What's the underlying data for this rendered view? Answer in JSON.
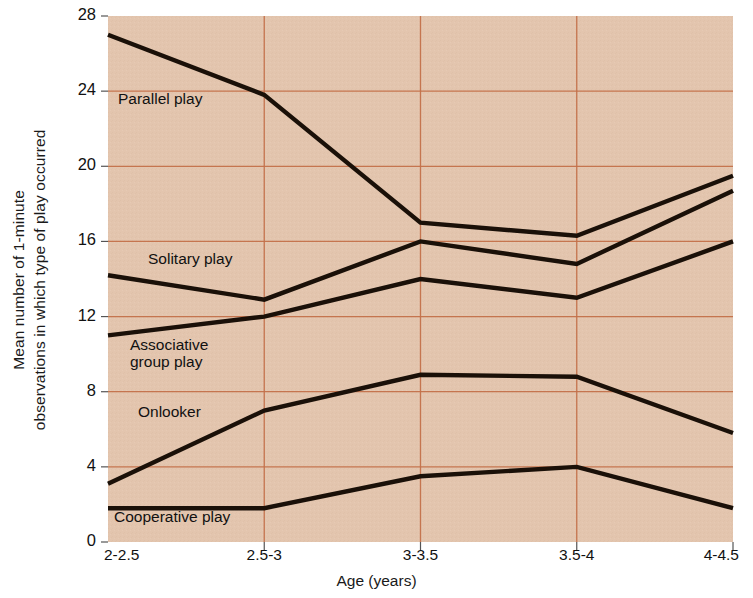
{
  "chart_data": {
    "type": "line",
    "title": "",
    "xlabel": "Age (years)",
    "ylabel_line1": "Mean number of 1-minute",
    "ylabel_line2": "observations in which type of play occurred",
    "categories": [
      "2-2.5",
      "2.5-3",
      "3-3.5",
      "3.5-4",
      "4-4.5"
    ],
    "ylim": [
      0,
      28
    ],
    "yticks": [
      0,
      4,
      8,
      12,
      16,
      20,
      24,
      28
    ],
    "grid": true,
    "legend": "inline-labels",
    "series": [
      {
        "name": "Parallel play",
        "values": [
          27.0,
          23.8,
          17.0,
          16.3,
          19.5
        ]
      },
      {
        "name": "Solitary play",
        "values": [
          14.2,
          12.9,
          16.0,
          14.8,
          18.7
        ]
      },
      {
        "name": "Associative group play",
        "values": [
          11.0,
          12.0,
          14.0,
          13.0,
          16.0
        ]
      },
      {
        "name": "Onlooker",
        "values": [
          3.1,
          7.0,
          8.9,
          8.8,
          5.8
        ]
      },
      {
        "name": "Cooperative play",
        "values": [
          1.8,
          1.8,
          3.5,
          4.0,
          1.8
        ]
      }
    ],
    "series_label_positions": [
      {
        "name": "Parallel play",
        "x": 118,
        "y": 90
      },
      {
        "name": "Solitary play",
        "x": 148,
        "y": 250
      },
      {
        "name": "Associative group play",
        "x": 130,
        "y": 336
      },
      {
        "name": "Onlooker",
        "x": 138,
        "y": 403
      },
      {
        "name": "Cooperative play",
        "x": 114,
        "y": 508
      }
    ],
    "colors": {
      "plot_background": "#e3c5ae",
      "gridline": "#c4714a",
      "series_line": "#1a1008",
      "text": "#111111",
      "page_background": "#ffffff"
    }
  }
}
